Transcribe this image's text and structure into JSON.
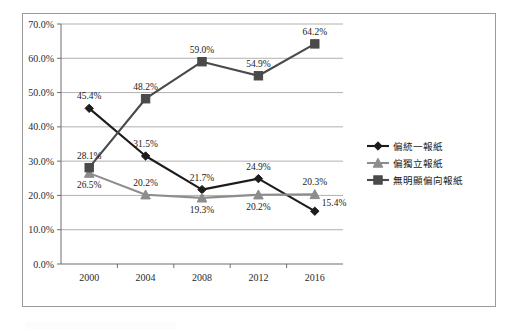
{
  "chart_data": {
    "type": "line",
    "title": "",
    "subtitle": "",
    "xlabel": "",
    "ylabel": "",
    "categories": [
      "2000",
      "2004",
      "2008",
      "2012",
      "2016"
    ],
    "x": [
      2000,
      2004,
      2008,
      2012,
      2016
    ],
    "ylim": [
      0,
      70
    ],
    "ytick_step": 10,
    "ytick_labels": [
      "0.0%",
      "10.0%",
      "20.0%",
      "30.0%",
      "40.0%",
      "50.0%",
      "60.0%",
      "70.0%"
    ],
    "ytick_values": [
      0,
      10,
      20,
      30,
      40,
      50,
      60,
      70
    ],
    "grid": true,
    "grid_axis": "y",
    "legend_position": "right",
    "series": [
      {
        "name": "偏統一報紙",
        "marker": "diamond",
        "color": "#1c1c1c",
        "values": [
          45.4,
          31.5,
          21.7,
          24.9,
          15.4
        ],
        "value_labels": [
          "45.4%",
          "31.5%",
          "21.7%",
          "24.9%",
          "15.4%"
        ],
        "label_positions": [
          "above",
          "above",
          "above",
          "above",
          "right"
        ]
      },
      {
        "name": "偏獨立報紙",
        "marker": "triangle",
        "color": "#8d8d8d",
        "values": [
          26.5,
          20.2,
          19.3,
          20.2,
          20.3
        ],
        "value_labels": [
          "26.5%",
          "20.2%",
          "19.3%",
          "20.2%",
          "20.3%"
        ],
        "label_positions": [
          "below",
          "above",
          "below",
          "below",
          "above"
        ]
      },
      {
        "name": "無明顯偏向報紙",
        "marker": "square",
        "color": "#4a4a4a",
        "values": [
          28.1,
          48.2,
          59.0,
          54.9,
          64.2
        ],
        "value_labels": [
          "28.1%",
          "48.2%",
          "59.0%",
          "54.9%",
          "64.2%"
        ],
        "label_positions": [
          "above",
          "above",
          "above",
          "above",
          "above"
        ]
      }
    ]
  },
  "legend": {
    "entries": [
      {
        "label": "偏統一報紙"
      },
      {
        "label": "偏獨立報紙"
      },
      {
        "label": "無明顯偏向報紙"
      }
    ]
  },
  "colors": {
    "series_tongyi": "#1c1c1c",
    "series_duli": "#8d8d8d",
    "series_wumingxian": "#4a4a4a",
    "gridline": "#9d9d9d",
    "axis": "#6d6d6d",
    "frame_border": "#9a9a9a",
    "background": "#ffffff"
  }
}
